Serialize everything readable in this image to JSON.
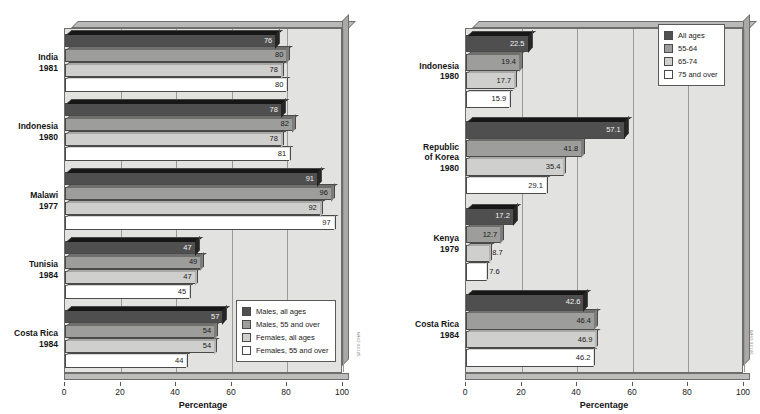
{
  "axis": {
    "title": "Percentage",
    "ticks": [
      "0",
      "20",
      "40",
      "60",
      "80",
      "100"
    ],
    "min": 0,
    "max": 100
  },
  "side_credit_left": "WHO 92145",
  "side_credit_right": "WHO 92146",
  "bottom_caption": "",
  "chart_data": [
    {
      "type": "bar",
      "orientation": "horizontal",
      "panel": "left",
      "title": "",
      "xlabel": "Percentage",
      "ylabel": "",
      "xlim": [
        0,
        100
      ],
      "grid": true,
      "legend_position": "bottom-right",
      "categories": [
        "India\n1981",
        "Indonesia\n1980",
        "Malawi\n1977",
        "Tunisia\n1984",
        "Costa Rica\n1984"
      ],
      "category_lines": [
        [
          "India",
          "1981"
        ],
        [
          "Indonesia",
          "1980"
        ],
        [
          "Malawi",
          "1977"
        ],
        [
          "Tunisia",
          "1984"
        ],
        [
          "Costa Rica",
          "1984"
        ]
      ],
      "series": [
        {
          "name": "Males, all ages",
          "color": "#4f4f4f",
          "values": [
            76,
            78,
            91,
            47,
            57
          ]
        },
        {
          "name": "Males, 55 and over",
          "color": "#9d9d9b",
          "values": [
            80,
            82,
            96,
            49,
            54
          ]
        },
        {
          "name": "Females, all ages",
          "color": "#cfcfcd",
          "values": [
            78,
            78,
            92,
            47,
            54
          ]
        },
        {
          "name": "Females, 55 and over",
          "color": "#ffffff",
          "values": [
            80,
            81,
            97,
            45,
            44
          ]
        }
      ]
    },
    {
      "type": "bar",
      "orientation": "horizontal",
      "panel": "right",
      "title": "",
      "xlabel": "Percentage",
      "ylabel": "",
      "xlim": [
        0,
        100
      ],
      "grid": true,
      "legend_position": "top-right",
      "categories": [
        "Indonesia\n1980",
        "Republic of Korea\n1980",
        "Kenya\n1979",
        "Costa Rica\n1984"
      ],
      "category_lines": [
        [
          "Indonesia",
          "1980"
        ],
        [
          "Republic",
          "of Korea",
          "1980"
        ],
        [
          "Kenya",
          "1979"
        ],
        [
          "Costa Rica",
          "1984"
        ]
      ],
      "series": [
        {
          "name": "All ages",
          "color": "#4f4f4f",
          "values": [
            22.5,
            57.1,
            17.2,
            42.6
          ]
        },
        {
          "name": "55-64",
          "color": "#9d9d9b",
          "values": [
            19.4,
            41.8,
            12.7,
            46.4
          ]
        },
        {
          "name": "65-74",
          "color": "#cfcfcd",
          "values": [
            17.7,
            35.4,
            8.7,
            46.9
          ]
        },
        {
          "name": "75 and over",
          "color": "#ffffff",
          "values": [
            15.9,
            29.1,
            7.6,
            46.2
          ]
        }
      ]
    }
  ]
}
